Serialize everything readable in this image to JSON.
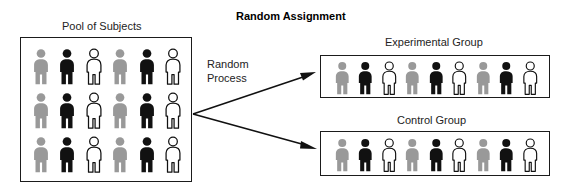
{
  "title": "Random Assignment",
  "pool": {
    "label": "Pool of Subjects",
    "rows": [
      [
        "gray",
        "black",
        "white",
        "gray",
        "black",
        "white"
      ],
      [
        "gray",
        "black",
        "white",
        "gray",
        "black",
        "white"
      ],
      [
        "gray",
        "black",
        "white",
        "gray",
        "black",
        "white"
      ]
    ]
  },
  "process": {
    "line1": "Random",
    "line2": "Process"
  },
  "groups": [
    {
      "label": "Experimental Group",
      "figures": [
        "gray",
        "black",
        "white",
        "gray",
        "black",
        "white",
        "gray",
        "black",
        "white"
      ]
    },
    {
      "label": "Control Group",
      "figures": [
        "gray",
        "black",
        "white",
        "gray",
        "black",
        "white",
        "gray",
        "black",
        "white"
      ]
    }
  ],
  "colors": {
    "gray": "#999999",
    "black": "#111111",
    "white": "#ffffff",
    "outline": "#111111",
    "box_border": "#1b1b1b",
    "text": "#232323",
    "arrow": "#111111"
  }
}
